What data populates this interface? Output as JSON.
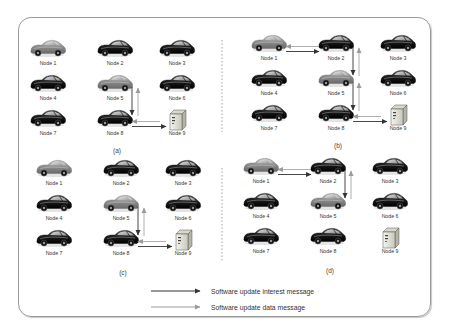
{
  "figure": {
    "panels": [
      {
        "id": "a",
        "label": "(a)",
        "nodes": [
          {
            "name": "Node 1",
            "type": "car",
            "shade": "light"
          },
          {
            "name": "Node 2",
            "type": "car",
            "shade": "dark"
          },
          {
            "name": "Node 3",
            "type": "car",
            "shade": "dark"
          },
          {
            "name": "Node 4",
            "type": "car",
            "shade": "dark"
          },
          {
            "name": "Node 5",
            "type": "car",
            "shade": "light"
          },
          {
            "name": "Node 6",
            "type": "car",
            "shade": "dark"
          },
          {
            "name": "Node 7",
            "type": "car",
            "shade": "dark"
          },
          {
            "name": "Node 8",
            "type": "car",
            "shade": "dark"
          },
          {
            "name": "Node 9",
            "type": "server",
            "shade": "server"
          }
        ],
        "links": [
          {
            "from": "Node 5",
            "to": "Node 8",
            "kind": "interest"
          },
          {
            "from": "Node 8",
            "to": "Node 5",
            "kind": "data"
          },
          {
            "from": "Node 8",
            "to": "Node 9",
            "kind": "interest"
          },
          {
            "from": "Node 9",
            "to": "Node 8",
            "kind": "data"
          }
        ]
      },
      {
        "id": "b",
        "label": "(b)",
        "nodes": [
          {
            "name": "Node 1",
            "type": "car",
            "shade": "light"
          },
          {
            "name": "Node 2",
            "type": "car",
            "shade": "dark"
          },
          {
            "name": "Node 3",
            "type": "car",
            "shade": "dark"
          },
          {
            "name": "Node 4",
            "type": "car",
            "shade": "dark"
          },
          {
            "name": "Node 5",
            "type": "car",
            "shade": "light"
          },
          {
            "name": "Node 6",
            "type": "car",
            "shade": "dark"
          },
          {
            "name": "Node 7",
            "type": "car",
            "shade": "dark"
          },
          {
            "name": "Node 8",
            "type": "car",
            "shade": "dark"
          },
          {
            "name": "Node 9",
            "type": "server",
            "shade": "server"
          }
        ],
        "links": [
          {
            "from": "Node 1",
            "to": "Node 2",
            "kind": "interest"
          },
          {
            "from": "Node 2",
            "to": "Node 1",
            "kind": "data"
          },
          {
            "from": "Node 2",
            "to": "Node 5",
            "kind": "interest"
          },
          {
            "from": "Node 5",
            "to": "Node 2",
            "kind": "data"
          },
          {
            "from": "Node 5",
            "to": "Node 8",
            "kind": "interest"
          },
          {
            "from": "Node 8",
            "to": "Node 5",
            "kind": "data"
          },
          {
            "from": "Node 8",
            "to": "Node 9",
            "kind": "interest"
          },
          {
            "from": "Node 9",
            "to": "Node 8",
            "kind": "data"
          }
        ]
      },
      {
        "id": "c",
        "label": "(c)",
        "nodes": [
          {
            "name": "Node 1",
            "type": "car",
            "shade": "light"
          },
          {
            "name": "Node 2",
            "type": "car",
            "shade": "dark"
          },
          {
            "name": "Node 3",
            "type": "car",
            "shade": "dark"
          },
          {
            "name": "Node 4",
            "type": "car",
            "shade": "dark"
          },
          {
            "name": "Node 5",
            "type": "car",
            "shade": "light"
          },
          {
            "name": "Node 6",
            "type": "car",
            "shade": "dark"
          },
          {
            "name": "Node 7",
            "type": "car",
            "shade": "dark"
          },
          {
            "name": "Node 8",
            "type": "car",
            "shade": "dark"
          },
          {
            "name": "Node 9",
            "type": "server",
            "shade": "server"
          }
        ],
        "links": [
          {
            "from": "Node 5",
            "to": "Node 8",
            "kind": "interest"
          },
          {
            "from": "Node 8",
            "to": "Node 5",
            "kind": "data"
          },
          {
            "from": "Node 8",
            "to": "Node 9",
            "kind": "interest"
          },
          {
            "from": "Node 9",
            "to": "Node 8",
            "kind": "data"
          }
        ]
      },
      {
        "id": "d",
        "label": "(d)",
        "nodes": [
          {
            "name": "Node 1",
            "type": "car",
            "shade": "light"
          },
          {
            "name": "Node 2",
            "type": "car",
            "shade": "dark"
          },
          {
            "name": "Node 3",
            "type": "car",
            "shade": "dark"
          },
          {
            "name": "Node 4",
            "type": "car",
            "shade": "dark"
          },
          {
            "name": "Node 5",
            "type": "car",
            "shade": "light"
          },
          {
            "name": "Node 6",
            "type": "car",
            "shade": "dark"
          },
          {
            "name": "Node 7",
            "type": "car",
            "shade": "dark"
          },
          {
            "name": "Node 8",
            "type": "car",
            "shade": "dark"
          },
          {
            "name": "Node 9",
            "type": "server",
            "shade": "server"
          }
        ],
        "links": [
          {
            "from": "Node 1",
            "to": "Node 2",
            "kind": "interest"
          },
          {
            "from": "Node 2",
            "to": "Node 1",
            "kind": "data"
          },
          {
            "from": "Node 2",
            "to": "Node 5",
            "kind": "interest"
          },
          {
            "from": "Node 5",
            "to": "Node 2",
            "kind": "data"
          }
        ]
      }
    ],
    "legend": [
      {
        "kind": "interest",
        "label": "Software update interest message",
        "color": "#333333"
      },
      {
        "kind": "data",
        "label": "Software update data message",
        "color": "#9a9a9a"
      }
    ],
    "colors": {
      "frame": "#9a9a9a",
      "divider": "#8a8a8a",
      "car_dark": "#1e1e1e",
      "car_light": "#8c8c8c",
      "server_body": "#e4e4da"
    }
  }
}
